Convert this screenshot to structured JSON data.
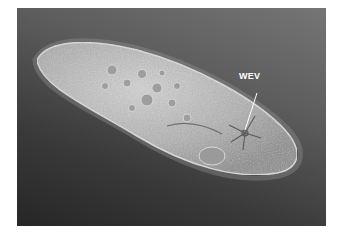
{
  "figure": {
    "type": "DIC micrograph",
    "colors": {
      "background_light": "#757575",
      "background_dark": "#262626",
      "cell_body": "#bdbdbd",
      "cell_highlight": "#e6e6e6",
      "label": "#ffffff"
    },
    "annotations": [
      {
        "text": "WEV",
        "pointer": "line to star-shaped vacuole near posterior end"
      }
    ]
  }
}
